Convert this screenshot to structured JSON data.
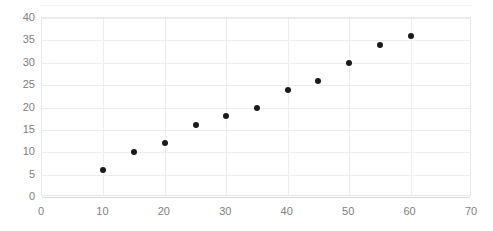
{
  "chart_data": {
    "type": "scatter",
    "title": "",
    "subtitle": "",
    "xlabel": "",
    "ylabel": "",
    "xlim": [
      0,
      70
    ],
    "ylim": [
      0,
      40
    ],
    "xticks": [
      0,
      10,
      20,
      30,
      40,
      50,
      60,
      70
    ],
    "yticks": [
      0,
      5,
      10,
      15,
      20,
      25,
      30,
      35,
      40
    ],
    "grid": true,
    "legend": false,
    "legend_position": "none",
    "marker_color": "#1a1a1a",
    "grid_color": "#ededed",
    "tick_label_color": "#808080",
    "series": [
      {
        "name": "",
        "points": [
          {
            "x": 10,
            "y": 6
          },
          {
            "x": 15,
            "y": 10
          },
          {
            "x": 20,
            "y": 12
          },
          {
            "x": 25,
            "y": 16
          },
          {
            "x": 30,
            "y": 18
          },
          {
            "x": 35,
            "y": 20
          },
          {
            "x": 40,
            "y": 24
          },
          {
            "x": 45,
            "y": 26
          },
          {
            "x": 50,
            "y": 30
          },
          {
            "x": 55,
            "y": 34
          },
          {
            "x": 60,
            "y": 36
          }
        ]
      }
    ]
  }
}
